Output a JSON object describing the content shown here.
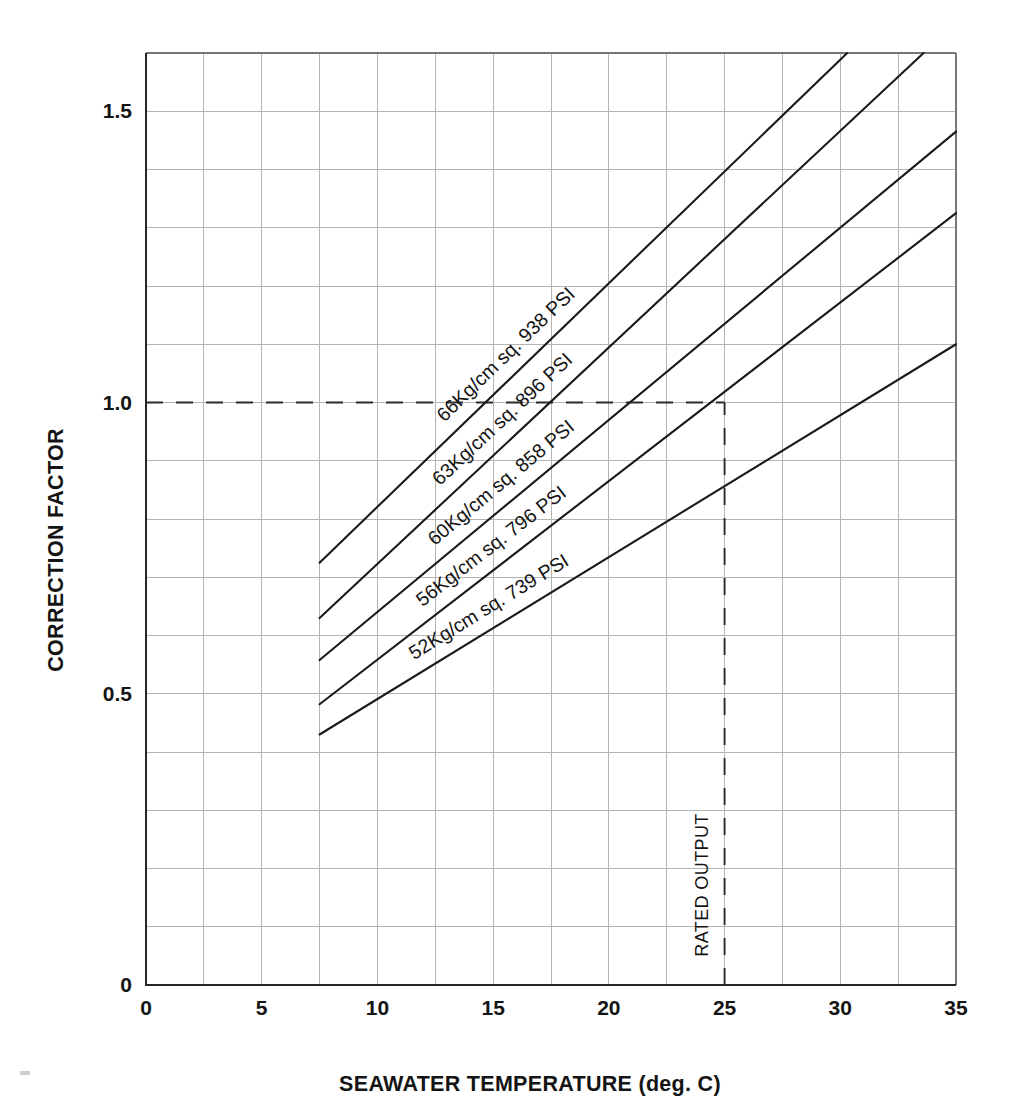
{
  "chart_data": {
    "type": "line",
    "title": "",
    "xlabel": "SEAWATER TEMPERATURE (deg. C)",
    "ylabel": "CORRECTION FACTOR",
    "xlim": [
      0,
      35
    ],
    "ylim": [
      0,
      1.6
    ],
    "xticks": [
      0,
      5,
      10,
      15,
      20,
      25,
      30,
      35
    ],
    "xtick_labels": [
      "0",
      "5",
      "10",
      "15",
      "20",
      "25",
      "30",
      "35"
    ],
    "yticks": [
      0,
      0.5,
      1.0,
      1.5
    ],
    "ytick_labels": [
      "0",
      "0.5",
      "1.0",
      "1.5"
    ],
    "grid": true,
    "grid_x_step": 2.5,
    "grid_y_step": 0.1,
    "legend": "inline-labels",
    "series": [
      {
        "name": "66Kg/cm sq. 938 PSI",
        "label": "66Kg/cm sq. 938 PSI",
        "x": [
          7.5,
          30.3
        ],
        "y": [
          0.725,
          1.6
        ]
      },
      {
        "name": "63Kg/cm sq. 896 PSI",
        "label": "63Kg/cm sq. 896 PSI",
        "x": [
          7.5,
          33.6
        ],
        "y": [
          0.63,
          1.6
        ]
      },
      {
        "name": "60Kg/cm sq. 858 PSI",
        "label": "60Kg/cm sq. 858 PSI",
        "x": [
          7.5,
          35.0
        ],
        "y": [
          0.558,
          1.465
        ]
      },
      {
        "name": "56Kg/cm sq. 796 PSI",
        "label": "56Kg/cm sq. 796 PSI",
        "x": [
          7.5,
          35.0
        ],
        "y": [
          0.482,
          1.325
        ]
      },
      {
        "name": "52Kg/cm sq. 739 PSI",
        "label": "52Kg/cm sq. 739 PSI",
        "x": [
          7.5,
          35.0
        ],
        "y": [
          0.43,
          1.1
        ]
      }
    ],
    "annotations": [
      {
        "name": "rated-output",
        "text": "RATED OUTPUT",
        "x": 25,
        "y_from": 0,
        "y_to": 1.0,
        "style": "dashed-vertical"
      },
      {
        "name": "correction-factor-unity",
        "text": "",
        "y": 1.0,
        "x_from": 0,
        "x_to": 25,
        "style": "dashed-horizontal"
      }
    ],
    "colors": {
      "series": "#1a1a1a",
      "grid": "#b4b4b4",
      "axis": "#262626",
      "background": "#ffffff"
    }
  }
}
